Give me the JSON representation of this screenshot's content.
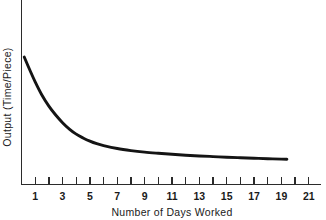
{
  "chart_data": {
    "type": "line",
    "title": "",
    "xlabel": "Number of Days Worked",
    "ylabel": "Output (Time/Piece)",
    "xlim": [
      0,
      22
    ],
    "ylim": [
      0,
      100
    ],
    "grid": false,
    "legend": false,
    "x_tick_labels": [
      "1",
      "3",
      "5",
      "7",
      "9",
      "11",
      "13",
      "15",
      "17",
      "19",
      "21"
    ],
    "x_tick_values": [
      1,
      3,
      5,
      7,
      9,
      11,
      13,
      15,
      17,
      19,
      21
    ],
    "x_minor_tick_values": [
      2,
      4,
      6,
      8,
      10,
      12,
      14,
      16,
      18,
      20
    ],
    "y_tick_labels": [],
    "series": [
      {
        "name": "Learning curve",
        "color": "#141414",
        "x": [
          0.2,
          0.6,
          1.0,
          1.5,
          2.0,
          2.5,
          3.0,
          3.5,
          4.0,
          4.5,
          5.0,
          5.5,
          6.0,
          7.0,
          8.0,
          9.0,
          10.0,
          11.0,
          12.0,
          13.0,
          14.0,
          15.0,
          16.0,
          17.0,
          18.0,
          19.0,
          19.4
        ],
        "y": [
          100.0,
          90.0,
          80.5,
          70.0,
          61.5,
          54.5,
          48.5,
          43.5,
          39.5,
          36.5,
          34.0,
          32.0,
          30.5,
          28.2,
          26.6,
          25.4,
          24.5,
          23.7,
          23.0,
          22.4,
          21.9,
          21.4,
          21.0,
          20.6,
          20.2,
          19.9,
          19.8
        ]
      }
    ]
  },
  "axes": {
    "x_axis_name": "horizontal-axis",
    "y_axis_name": "vertical-axis"
  }
}
